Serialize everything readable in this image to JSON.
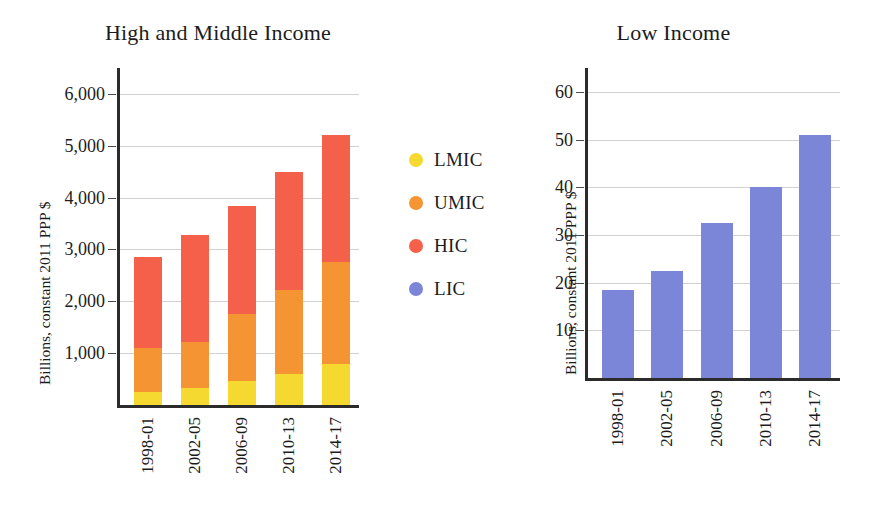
{
  "chart_data": [
    {
      "id": "high-middle-income",
      "type": "bar",
      "subtype": "stacked-bar",
      "title": "High and Middle Income",
      "xlabel": "",
      "ylabel": "Billions, constant 2011 PPP $",
      "categories": [
        "1998-01",
        "2002-05",
        "2006-09",
        "2010-13",
        "2014-17"
      ],
      "ylim": [
        0,
        6500
      ],
      "yticks": [
        1000,
        2000,
        3000,
        4000,
        5000,
        6000
      ],
      "ytick_labels": [
        "1,000",
        "2,000",
        "3,000",
        "4,000",
        "5,000",
        "6,000"
      ],
      "grid": true,
      "legend_position": "right",
      "series": [
        {
          "name": "LMIC",
          "color": "#f5d930",
          "values": [
            250,
            330,
            470,
            600,
            800
          ]
        },
        {
          "name": "UMIC",
          "color": "#f59432",
          "values": [
            850,
            880,
            1280,
            1620,
            1950
          ]
        },
        {
          "name": "HIC",
          "color": "#f4604a",
          "values": [
            1750,
            2070,
            2080,
            2280,
            2450
          ]
        }
      ],
      "totals": [
        2850,
        3280,
        3830,
        4500,
        5200
      ]
    },
    {
      "id": "low-income",
      "type": "bar",
      "subtype": "bar",
      "title": "Low Income",
      "xlabel": "",
      "ylabel": "Billions, constant 2011 PPP $",
      "categories": [
        "1998-01",
        "2002-05",
        "2006-09",
        "2010-13",
        "2014-17"
      ],
      "ylim": [
        0,
        65
      ],
      "yticks": [
        10,
        20,
        30,
        40,
        50,
        60
      ],
      "ytick_labels": [
        "10",
        "20",
        "30",
        "40",
        "50",
        "60"
      ],
      "grid": true,
      "series": [
        {
          "name": "LIC",
          "color": "#7b86d8",
          "values": [
            18.5,
            22.5,
            32.5,
            40,
            51
          ]
        }
      ]
    }
  ],
  "legend": {
    "items": [
      {
        "label": "LMIC",
        "color": "#f5d930"
      },
      {
        "label": "UMIC",
        "color": "#f59432"
      },
      {
        "label": "HIC",
        "color": "#f4604a"
      },
      {
        "label": "LIC",
        "color": "#7b86d8"
      }
    ]
  }
}
